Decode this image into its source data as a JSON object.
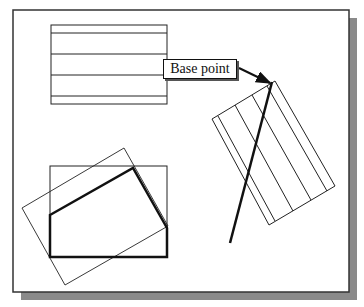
{
  "diagram": {
    "label": "Base point",
    "colors": {
      "frame": "#333333",
      "shadow": "#8a8a8a",
      "line": "#222222",
      "background": "#ffffff"
    },
    "frame": {
      "x": 13,
      "y": 10,
      "w": 336,
      "h": 282
    },
    "shadow": {
      "offset": 8
    },
    "top_rect": {
      "x": 51,
      "y": 25,
      "w": 116,
      "h": 79,
      "inner_lines_y": [
        33,
        54,
        75,
        96
      ]
    },
    "bottom_rect": {
      "x": 50,
      "y": 166,
      "w": 117,
      "h": 91
    },
    "bold_polygon": "50,215 133,168 167,228 167,257 50,257",
    "rotated_rect_left": "22,208 124,148 168,226 65,285",
    "rotated_rect_right": "212,119 275,81 335,186 269,225",
    "right_rect_lines": [
      [
        218,
        116,
        275,
        221
      ],
      [
        235,
        105,
        293,
        211
      ],
      [
        252,
        95,
        311,
        200
      ],
      [
        267,
        86,
        327,
        191
      ]
    ],
    "thick_line": [
      272,
      82,
      230,
      243
    ],
    "arrow": [
      239,
      68,
      270,
      83
    ]
  }
}
